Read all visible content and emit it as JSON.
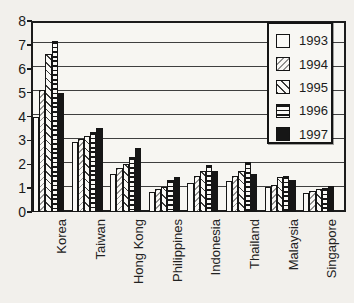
{
  "chart_data": {
    "type": "bar",
    "title": "",
    "xlabel": "",
    "ylabel": "",
    "categories": [
      "Korea",
      "Taiwan",
      "Hong Kong",
      "Philippines",
      "Indonesia",
      "Thailand",
      "Malaysia",
      "Singapore"
    ],
    "series": [
      {
        "name": "1993",
        "pattern": "plain",
        "values": [
          4.0,
          2.95,
          1.6,
          0.85,
          1.2,
          1.3,
          1.05,
          0.8
        ]
      },
      {
        "name": "1994",
        "pattern": "hatch-light",
        "values": [
          5.1,
          3.05,
          1.85,
          0.95,
          1.5,
          1.5,
          1.15,
          0.9
        ]
      },
      {
        "name": "1995",
        "pattern": "hatch-diag",
        "values": [
          6.6,
          3.2,
          2.0,
          1.05,
          1.7,
          1.7,
          1.45,
          0.95
        ]
      },
      {
        "name": "1996",
        "pattern": "hstripes",
        "values": [
          7.15,
          3.35,
          2.3,
          1.35,
          1.95,
          2.1,
          1.5,
          1.0
        ]
      },
      {
        "name": "1997",
        "pattern": "solid",
        "values": [
          5.0,
          3.5,
          2.7,
          1.45,
          1.7,
          1.6,
          1.35,
          1.1
        ]
      }
    ],
    "ylim": [
      0,
      8
    ],
    "ytick_step": 1,
    "yticks": [
      "0",
      "1",
      "2",
      "3",
      "4",
      "5",
      "6",
      "7",
      "8"
    ],
    "grid": true,
    "legend_position": "top-right"
  },
  "colors": {
    "ink": "#1c1c1c",
    "paper": "#f2f0ec",
    "plot_background": "#f7f6f2",
    "bar_white": "#faf9f6",
    "solid_fill": "#161616",
    "gridline": "#3f3f3f"
  },
  "layout_values": {
    "plot": {
      "left": 31,
      "top": 21,
      "width": 315,
      "height": 191
    },
    "group_stride": 38.6,
    "group_offset": 2,
    "bar_width": 6.2,
    "legend": {
      "left": 267,
      "top": 22,
      "width": 66,
      "height": 122
    },
    "category_label_top": 219
  }
}
